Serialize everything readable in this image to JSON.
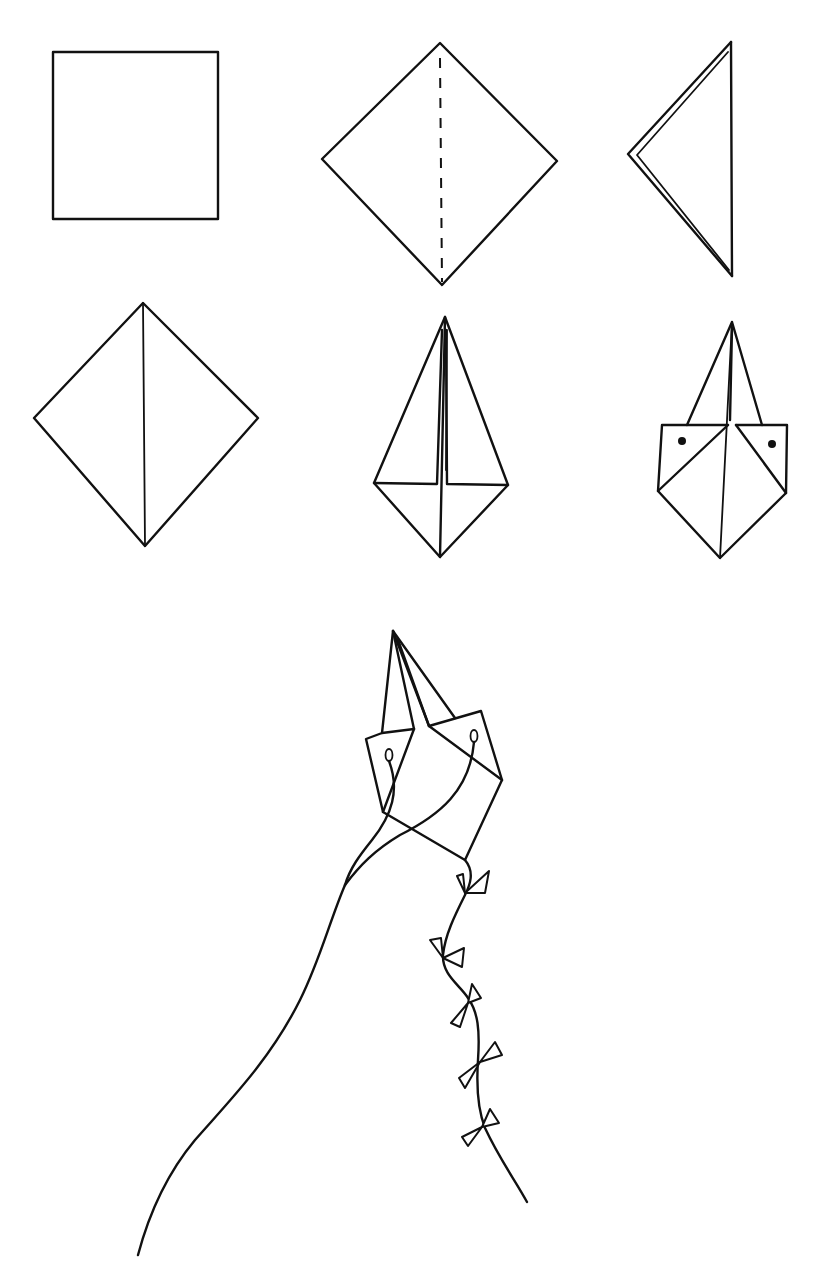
{
  "figure": {
    "type": "origami kite folding instructions",
    "steps": [
      {
        "step": 1,
        "description": "square sheet of paper"
      },
      {
        "step": 2,
        "description": "turned as a diamond with dashed center fold line"
      },
      {
        "step": 3,
        "description": "folded in half, side view"
      },
      {
        "step": 4,
        "description": "unfolded diamond with center crease"
      },
      {
        "step": 5,
        "description": "sides folded toward center crease"
      },
      {
        "step": 6,
        "description": "corners folded back with two punched holes"
      },
      {
        "step": 7,
        "description": "finished kite with string and bow tail"
      }
    ],
    "colors": {
      "ink": "#111111",
      "paper": "#ffffff"
    }
  }
}
